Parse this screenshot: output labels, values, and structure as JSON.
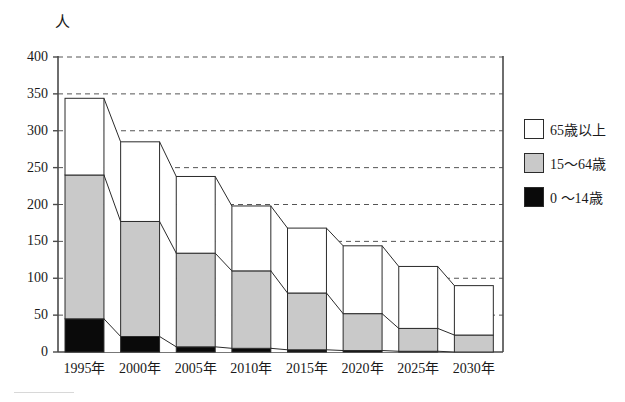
{
  "chart_data": {
    "type": "bar",
    "title": "",
    "subtitle": "",
    "xlabel": "",
    "ylabel": "人",
    "unit_label": "人",
    "stacked": true,
    "grid": true,
    "grid_style": "dashed-horizontal",
    "legend_position": "right",
    "ylim": [
      0,
      400
    ],
    "ytick_step": 50,
    "yticks": [
      "0",
      "50",
      "100",
      "150",
      "200",
      "250",
      "300",
      "350",
      "400"
    ],
    "ytick_values": [
      0,
      50,
      100,
      150,
      200,
      250,
      300,
      350,
      400
    ],
    "categories": [
      "1995年",
      "2000年",
      "2005年",
      "2010年",
      "2015年",
      "2020年",
      "2025年",
      "2030年"
    ],
    "series": [
      {
        "name": "0〜14歳",
        "color": "#0a0a0a",
        "values": [
          45,
          21,
          7,
          5,
          3,
          2,
          1,
          0
        ]
      },
      {
        "name": "15〜64歳",
        "color": "#c9c9c9",
        "values": [
          195,
          156,
          127,
          105,
          77,
          50,
          31,
          23
        ]
      },
      {
        "name": "65歳以上",
        "color": "#ffffff",
        "values": [
          104,
          108,
          104,
          88,
          88,
          92,
          84,
          67
        ]
      }
    ],
    "cumulative_tops": {
      "black": [
        45,
        21,
        7,
        5,
        3,
        2,
        1,
        0
      ],
      "gray": [
        240,
        177,
        134,
        110,
        80,
        52,
        32,
        23
      ],
      "total": [
        344,
        285,
        238,
        198,
        168,
        144,
        116,
        90
      ]
    }
  },
  "legend": {
    "items": [
      {
        "label": "65歳以上",
        "swatch": "white"
      },
      {
        "label": "15〜64歳",
        "swatch": "gray"
      },
      {
        "label": "0 〜14歳",
        "swatch": "black"
      }
    ]
  },
  "colors": {
    "axis": "#4a4a4a",
    "grid": "#555555",
    "bar_outline": "#2b2b2b",
    "segment_black": "#0a0a0a",
    "segment_gray": "#c9c9c9",
    "segment_white": "#ffffff",
    "background": "#ffffff"
  }
}
